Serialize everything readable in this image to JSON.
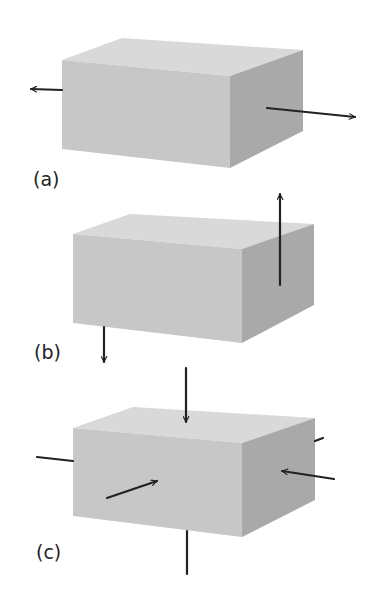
{
  "figure": {
    "panels": [
      {
        "id": "a",
        "label": "(a)",
        "description": "Block under uniaxial tension: opposing arrows pulling outward along length",
        "box": {
          "front": [
            [
              62,
              60
            ],
            [
              230,
              76
            ],
            [
              230,
              168
            ],
            [
              62,
              149
            ]
          ],
          "top": [
            [
              62,
              60
            ],
            [
              122,
              38
            ],
            [
              303,
              50
            ],
            [
              230,
              76
            ]
          ],
          "right": [
            [
              230,
              76
            ],
            [
              303,
              50
            ],
            [
              303,
              131
            ],
            [
              230,
              168
            ]
          ]
        },
        "arrows": [
          {
            "from": [
              62,
              90
            ],
            "to": [
              31,
              89
            ],
            "head": true
          },
          {
            "from": [
              267,
              108
            ],
            "to": [
              355,
              117
            ],
            "head": true
          }
        ],
        "label_pos": [
          33,
          170
        ]
      },
      {
        "id": "b",
        "label": "(b)",
        "description": "Block under shear: opposite vertical arrows on opposite faces",
        "box": {
          "front": [
            [
              73,
              234
            ],
            [
              242,
              249
            ],
            [
              242,
              343
            ],
            [
              73,
              323
            ]
          ],
          "top": [
            [
              73,
              234
            ],
            [
              130,
              214
            ],
            [
              314,
              224
            ],
            [
              242,
              249
            ]
          ],
          "right": [
            [
              242,
              249
            ],
            [
              314,
              224
            ],
            [
              314,
              305
            ],
            [
              242,
              343
            ]
          ]
        },
        "arrows": [
          {
            "from": [
              280,
              285
            ],
            "to": [
              280,
              194
            ],
            "head": true
          },
          {
            "from": [
              104,
              327
            ],
            "to": [
              104,
              362
            ],
            "head": true
          }
        ],
        "label_pos": [
          34,
          343
        ]
      },
      {
        "id": "c",
        "label": "(c)",
        "description": "Block under hydrostatic compression: arrows pressing inward on all faces",
        "box": {
          "front": [
            [
              73,
              428
            ],
            [
              242,
              443
            ],
            [
              242,
              537
            ],
            [
              73,
              516
            ]
          ],
          "top": [
            [
              73,
              428
            ],
            [
              133,
              407
            ],
            [
              315,
              418
            ],
            [
              242,
              443
            ]
          ],
          "right": [
            [
              242,
              443
            ],
            [
              315,
              418
            ],
            [
              315,
              500
            ],
            [
              242,
              537
            ]
          ]
        },
        "arrows": [
          {
            "from": [
              186,
              368
            ],
            "to": [
              186,
              422
            ],
            "head": true
          },
          {
            "from": [
              107,
              498
            ],
            "to": [
              157,
              481
            ],
            "head": true
          },
          {
            "from": [
              334,
              479
            ],
            "to": [
              282,
              471
            ],
            "head": true
          }
        ],
        "lines": [
          {
            "from": [
              37,
              457
            ],
            "to": [
              73,
              461
            ]
          },
          {
            "from": [
              315,
              441
            ],
            "to": [
              323,
              438
            ]
          },
          {
            "from": [
              187,
              531
            ],
            "to": [
              187,
              574
            ]
          }
        ],
        "label_pos": [
          36,
          543
        ]
      }
    ],
    "colors": {
      "top_face": "#d9d9d9",
      "front_face": "#c7c7c7",
      "right_face": "#a9a9a9",
      "stroke": "#222222"
    }
  }
}
